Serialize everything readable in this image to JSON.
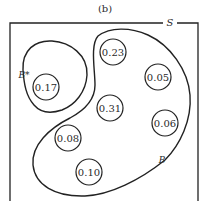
{
  "figure": {
    "caption": "(b)",
    "sample_space_label": "S",
    "event_labels": {
      "b_star": "B*",
      "b": "B"
    },
    "outcomes": [
      {
        "value": "0.17",
        "cx": 46,
        "cy": 87,
        "region": "B*"
      },
      {
        "value": "0.23",
        "cx": 113,
        "cy": 52,
        "region": "B"
      },
      {
        "value": "0.05",
        "cx": 158,
        "cy": 77,
        "region": "B"
      },
      {
        "value": "0.31",
        "cx": 110,
        "cy": 108,
        "region": "B"
      },
      {
        "value": "0.06",
        "cx": 165,
        "cy": 123,
        "region": "B"
      },
      {
        "value": "0.08",
        "cx": 68,
        "cy": 138,
        "region": "B"
      },
      {
        "value": "0.10",
        "cx": 89,
        "cy": 172,
        "region": "B"
      }
    ]
  }
}
